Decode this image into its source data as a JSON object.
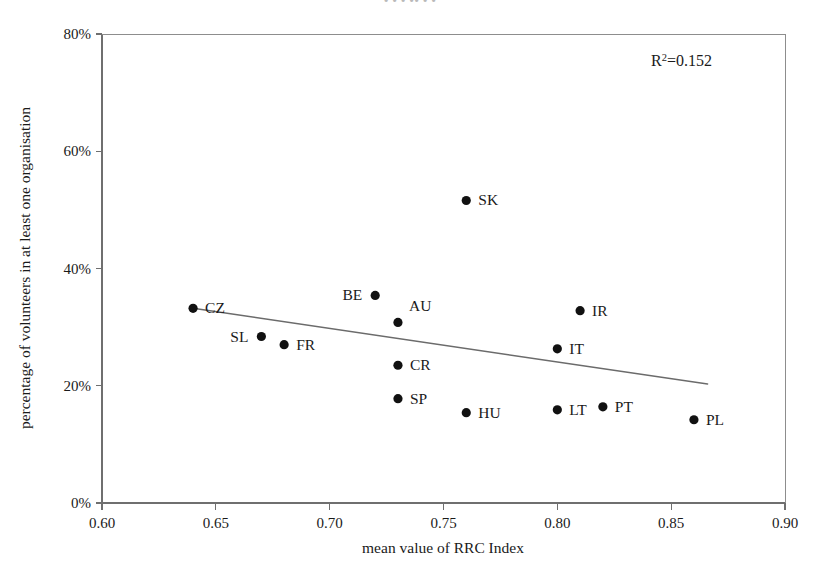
{
  "figure": {
    "clipped_header_text": "•                    •                     • ••  •                     •",
    "background_color": "#ffffff",
    "point_color": "#111111",
    "trendline_color": "#6b6b6b",
    "axis_color": "#6f6f6f"
  },
  "annotation": {
    "r2_prefix": "R",
    "r2_exponent": "2",
    "r2_value": "=0.152"
  },
  "chart_data": {
    "type": "scatter",
    "title": "",
    "xlabel": "mean value of RRC Index",
    "ylabel": "percentage of volunteers in at least one organisation",
    "xlim": [
      0.6,
      0.9
    ],
    "ylim": [
      0,
      80
    ],
    "xticks": [
      0.6,
      0.65,
      0.7,
      0.75,
      0.8,
      0.85,
      0.9
    ],
    "xtick_labels": [
      "0.60",
      "0.65",
      "0.70",
      "0.75",
      "0.80",
      "0.85",
      "0.90"
    ],
    "yticks": [
      0,
      20,
      40,
      60,
      80
    ],
    "ytick_labels": [
      "0%",
      "20%",
      "40%",
      "60%",
      "80%"
    ],
    "grid": false,
    "legend": "none",
    "r_squared": 0.152,
    "points": [
      {
        "label": "CZ",
        "x": 0.64,
        "y": 33.2,
        "label_pos": "right"
      },
      {
        "label": "SL",
        "x": 0.67,
        "y": 28.4,
        "label_pos": "left"
      },
      {
        "label": "FR",
        "x": 0.68,
        "y": 27.0,
        "label_pos": "right"
      },
      {
        "label": "BE",
        "x": 0.72,
        "y": 35.4,
        "label_pos": "left"
      },
      {
        "label": "AU",
        "x": 0.73,
        "y": 30.8,
        "label_pos": "upper-right"
      },
      {
        "label": "CR",
        "x": 0.73,
        "y": 23.5,
        "label_pos": "right"
      },
      {
        "label": "SP",
        "x": 0.73,
        "y": 17.8,
        "label_pos": "right"
      },
      {
        "label": "SK",
        "x": 0.76,
        "y": 51.6,
        "label_pos": "right"
      },
      {
        "label": "HU",
        "x": 0.76,
        "y": 15.4,
        "label_pos": "right"
      },
      {
        "label": "IT",
        "x": 0.8,
        "y": 26.3,
        "label_pos": "right"
      },
      {
        "label": "LT",
        "x": 0.8,
        "y": 15.9,
        "label_pos": "right"
      },
      {
        "label": "IR",
        "x": 0.81,
        "y": 32.8,
        "label_pos": "right"
      },
      {
        "label": "PT",
        "x": 0.82,
        "y": 16.4,
        "label_pos": "right"
      },
      {
        "label": "PL",
        "x": 0.86,
        "y": 14.2,
        "label_pos": "right"
      }
    ],
    "trendline": {
      "x_start": 0.64,
      "y_start": 33.2,
      "x_end": 0.866,
      "y_end": 20.3
    }
  }
}
